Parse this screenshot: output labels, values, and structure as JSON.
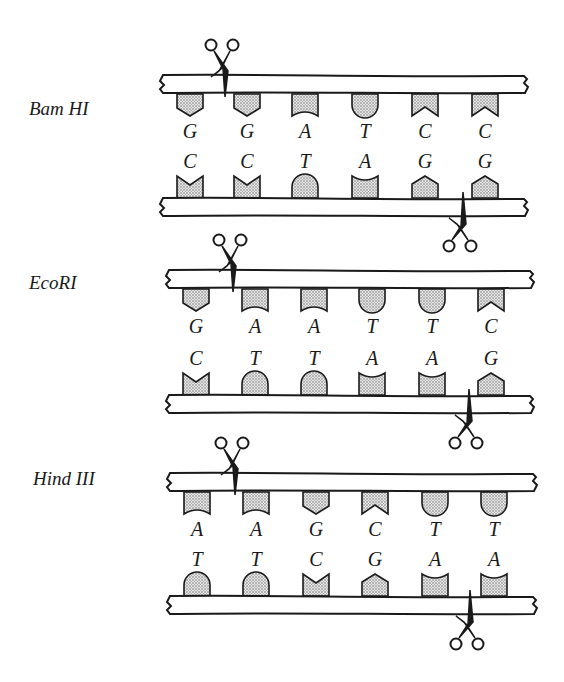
{
  "diagram": {
    "sections": [
      {
        "enzyme": "Bam HI",
        "label_pos": [
          29,
          98
        ],
        "top_strand_y": 75,
        "bottom_strand_y": 198,
        "columns": [
          190,
          247,
          305,
          365,
          425,
          485
        ],
        "top_bases": [
          "G",
          "G",
          "A",
          "T",
          "C",
          "C"
        ],
        "bottom_bases": [
          "C",
          "C",
          "T",
          "A",
          "G",
          "G"
        ],
        "top_cut_x": 220,
        "bottom_cut_x": 458
      },
      {
        "enzyme": "EcoRI",
        "label_pos": [
          29,
          272
        ],
        "top_strand_y": 270,
        "bottom_strand_y": 395,
        "columns": [
          196,
          255,
          314,
          372,
          432,
          491
        ],
        "top_bases": [
          "G",
          "A",
          "A",
          "T",
          "T",
          "C"
        ],
        "bottom_bases": [
          "C",
          "T",
          "T",
          "A",
          "A",
          "G"
        ],
        "top_cut_x": 228,
        "bottom_cut_x": 464
      },
      {
        "enzyme": "Hind III",
        "label_pos": [
          33,
          468
        ],
        "top_strand_y": 473,
        "bottom_strand_y": 596,
        "columns": [
          197,
          256,
          316,
          375,
          435,
          494
        ],
        "top_bases": [
          "A",
          "A",
          "G",
          "C",
          "T",
          "T"
        ],
        "bottom_bases": [
          "T",
          "T",
          "C",
          "G",
          "A",
          "A"
        ],
        "top_cut_x": 230,
        "bottom_cut_x": 465
      }
    ],
    "colors": {
      "ink": "#1a1a1a",
      "base_fill": "#c8c8c8",
      "strand_fill": "#ffffff"
    },
    "icons": {
      "cut": "scissors-icon"
    }
  }
}
